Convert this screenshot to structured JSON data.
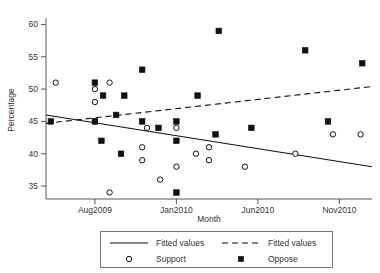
{
  "chart_data": {
    "type": "scatter",
    "title": "",
    "xlabel": "Month",
    "ylabel": "Percentage",
    "xlim": [
      0,
      20
    ],
    "ylim": [
      33,
      61
    ],
    "grid": false,
    "legend_position": "bottom",
    "yticks": [
      35,
      40,
      45,
      50,
      55,
      60
    ],
    "ytick_labels": [
      "35",
      "40",
      "45",
      "50",
      "55",
      "60"
    ],
    "xticks": [
      3,
      8,
      13,
      18
    ],
    "xtick_labels": [
      "Aug2009",
      "Jan2010",
      "Jun2010",
      "Nov2010"
    ],
    "series": [
      {
        "name": "Support",
        "marker": "open-circle",
        "points": [
          {
            "x": 0.6,
            "y": 51
          },
          {
            "x": 3.0,
            "y": 50
          },
          {
            "x": 3.0,
            "y": 48
          },
          {
            "x": 3.0,
            "y": 45
          },
          {
            "x": 3.9,
            "y": 51
          },
          {
            "x": 3.9,
            "y": 34
          },
          {
            "x": 5.9,
            "y": 41
          },
          {
            "x": 5.9,
            "y": 39
          },
          {
            "x": 6.2,
            "y": 44
          },
          {
            "x": 7.0,
            "y": 36
          },
          {
            "x": 8.0,
            "y": 44
          },
          {
            "x": 8.0,
            "y": 38
          },
          {
            "x": 9.2,
            "y": 40
          },
          {
            "x": 10.0,
            "y": 41
          },
          {
            "x": 10.0,
            "y": 39
          },
          {
            "x": 12.2,
            "y": 38
          },
          {
            "x": 15.3,
            "y": 40
          },
          {
            "x": 17.6,
            "y": 43
          },
          {
            "x": 19.3,
            "y": 43
          }
        ]
      },
      {
        "name": "Oppose",
        "marker": "filled-square",
        "points": [
          {
            "x": 0.3,
            "y": 45
          },
          {
            "x": 3.0,
            "y": 51
          },
          {
            "x": 3.0,
            "y": 45
          },
          {
            "x": 3.5,
            "y": 49
          },
          {
            "x": 3.4,
            "y": 42
          },
          {
            "x": 4.3,
            "y": 46
          },
          {
            "x": 4.8,
            "y": 49
          },
          {
            "x": 4.6,
            "y": 40
          },
          {
            "x": 5.9,
            "y": 53
          },
          {
            "x": 5.9,
            "y": 45
          },
          {
            "x": 6.9,
            "y": 44
          },
          {
            "x": 8.0,
            "y": 45
          },
          {
            "x": 8.0,
            "y": 42
          },
          {
            "x": 8.0,
            "y": 34
          },
          {
            "x": 9.3,
            "y": 49
          },
          {
            "x": 10.6,
            "y": 59
          },
          {
            "x": 10.4,
            "y": 43
          },
          {
            "x": 12.6,
            "y": 44
          },
          {
            "x": 15.9,
            "y": 56
          },
          {
            "x": 17.3,
            "y": 45
          },
          {
            "x": 19.4,
            "y": 54
          }
        ]
      }
    ],
    "fits": [
      {
        "name": "Fitted values",
        "style": "solid",
        "series_ref": "Support",
        "x0": 0.0,
        "y0": 46.0,
        "x1": 20.0,
        "y1": 38.0
      },
      {
        "name": "Fitted values",
        "style": "dashed",
        "series_ref": "Oppose",
        "x0": 0.0,
        "y0": 44.7,
        "x1": 20.0,
        "y1": 50.4
      }
    ]
  },
  "legend": {
    "entries": [
      {
        "label": "Fitted values",
        "symbol": "solid-line"
      },
      {
        "label": "Fitted values",
        "symbol": "dashed-line"
      },
      {
        "label": "Support",
        "symbol": "open-circle"
      },
      {
        "label": "Oppose",
        "symbol": "filled-square"
      }
    ]
  }
}
